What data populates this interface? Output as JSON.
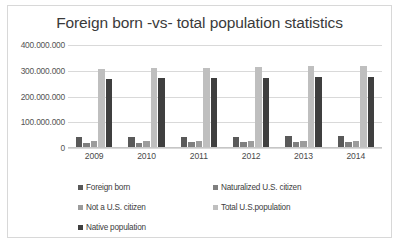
{
  "chart_data": {
    "type": "bar",
    "title": "Foreign born -vs- total population statistics",
    "xlabel": "",
    "ylabel": "",
    "categories": [
      "2009",
      "2010",
      "2011",
      "2012",
      "2013",
      "2014"
    ],
    "ylim": [
      0,
      400000000
    ],
    "yticks": [
      0,
      100000000,
      200000000,
      300000000,
      400000000
    ],
    "ytick_labels": [
      "0",
      "100.000.000",
      "200.000.000",
      "300.000.000",
      "400.000.000"
    ],
    "grid": true,
    "legend_position": "bottom",
    "series": [
      {
        "name": "Foreign born",
        "color": "#595959",
        "values": [
          38500000,
          40000000,
          40400000,
          40800000,
          41300000,
          42400000
        ]
      },
      {
        "name": "Naturalized U.S. citizen",
        "color": "#7f7f7f",
        "values": [
          16000000,
          17500000,
          18000000,
          18700000,
          19400000,
          20000000
        ]
      },
      {
        "name": "Not a U.S. citizen",
        "color": "#9c9c9c",
        "values": [
          22500000,
          22500000,
          22400000,
          22100000,
          21900000,
          22400000
        ]
      },
      {
        "name": "Total U.S.population",
        "color": "#bfbfbf",
        "values": [
          307000000,
          309000000,
          311000000,
          313000000,
          316000000,
          318000000
        ]
      },
      {
        "name": "Native population",
        "color": "#3f3f3f",
        "values": [
          268500000,
          269000000,
          270600000,
          272200000,
          274700000,
          275600000
        ]
      }
    ]
  },
  "colors": {
    "card_border": "#d8d8d8",
    "gridline": "#d9d9d9",
    "title_text": "#3a3a3a",
    "axis_text": "#545454"
  }
}
